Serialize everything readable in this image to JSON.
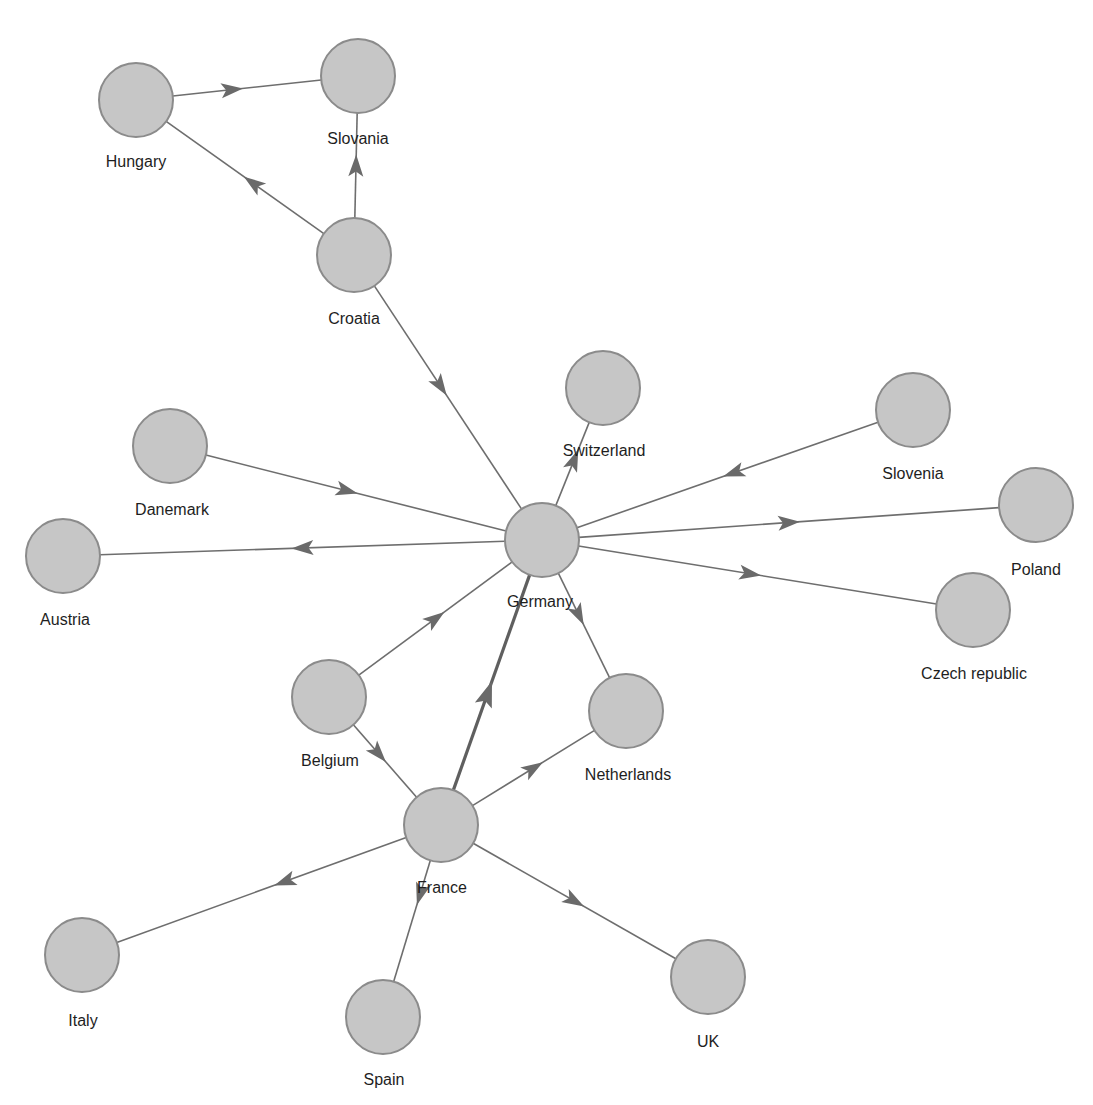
{
  "diagram": {
    "type": "directed-graph",
    "node_radius": 37,
    "colors": {
      "node_fill": "#c6c6c6",
      "node_stroke": "#8b8b8b",
      "edge": "#6e6e6e",
      "arrow": "#6a6a6a",
      "label": "#1e1e1e"
    },
    "nodes": [
      {
        "id": "hungary",
        "label": "Hungary",
        "x": 136,
        "y": 100,
        "lx": 136,
        "ly": 163
      },
      {
        "id": "slovania",
        "label": "Slovania",
        "x": 358,
        "y": 76,
        "lx": 358,
        "ly": 140
      },
      {
        "id": "croatia",
        "label": "Croatia",
        "x": 354,
        "y": 255,
        "lx": 354,
        "ly": 320
      },
      {
        "id": "switzerland",
        "label": "Switzerland",
        "x": 603,
        "y": 388,
        "lx": 604,
        "ly": 452
      },
      {
        "id": "slovenia",
        "label": "Slovenia",
        "x": 913,
        "y": 410,
        "lx": 913,
        "ly": 475
      },
      {
        "id": "danemark",
        "label": "Danemark",
        "x": 170,
        "y": 446,
        "lx": 172,
        "ly": 511
      },
      {
        "id": "germany",
        "label": "Germany",
        "x": 542,
        "y": 540,
        "lx": 540,
        "ly": 603
      },
      {
        "id": "poland",
        "label": "Poland",
        "x": 1036,
        "y": 505,
        "lx": 1036,
        "ly": 571
      },
      {
        "id": "austria",
        "label": "Austria",
        "x": 63,
        "y": 556,
        "lx": 65,
        "ly": 621
      },
      {
        "id": "czech",
        "label": "Czech republic",
        "x": 973,
        "y": 610,
        "lx": 974,
        "ly": 675
      },
      {
        "id": "belgium",
        "label": "Belgium",
        "x": 329,
        "y": 697,
        "lx": 330,
        "ly": 762
      },
      {
        "id": "netherlands",
        "label": "Netherlands",
        "x": 626,
        "y": 711,
        "lx": 628,
        "ly": 776
      },
      {
        "id": "france",
        "label": "France",
        "x": 441,
        "y": 825,
        "lx": 442,
        "ly": 889
      },
      {
        "id": "italy",
        "label": "Italy",
        "x": 82,
        "y": 955,
        "lx": 83,
        "ly": 1022
      },
      {
        "id": "spain",
        "label": "Spain",
        "x": 383,
        "y": 1017,
        "lx": 384,
        "ly": 1081
      },
      {
        "id": "uk",
        "label": "UK",
        "x": 708,
        "y": 977,
        "lx": 708,
        "ly": 1043
      }
    ],
    "edges": [
      {
        "from": "hungary",
        "to": "slovania",
        "arrow_t": 0.4
      },
      {
        "from": "croatia",
        "to": "slovania",
        "arrow_t": 0.5
      },
      {
        "from": "croatia",
        "to": "hungary",
        "arrow_t": 0.45
      },
      {
        "from": "croatia",
        "to": "germany",
        "arrow_t": 0.45
      },
      {
        "from": "danemark",
        "to": "germany",
        "arrow_t": 0.47
      },
      {
        "from": "germany",
        "to": "austria",
        "arrow_t": 0.5
      },
      {
        "from": "germany",
        "to": "switzerland",
        "arrow_t": 0.55
      },
      {
        "from": "slovenia",
        "to": "germany",
        "arrow_t": 0.48
      },
      {
        "from": "germany",
        "to": "poland",
        "arrow_t": 0.5
      },
      {
        "from": "germany",
        "to": "czech",
        "arrow_t": 0.48
      },
      {
        "from": "germany",
        "to": "netherlands",
        "arrow_t": 0.4
      },
      {
        "from": "belgium",
        "to": "germany",
        "arrow_t": 0.5
      },
      {
        "from": "belgium",
        "to": "france",
        "arrow_t": 0.4
      },
      {
        "from": "france",
        "to": "germany",
        "arrow_t": 0.45,
        "heavy": true
      },
      {
        "from": "france",
        "to": "netherlands",
        "arrow_t": 0.5
      },
      {
        "from": "france",
        "to": "italy",
        "arrow_t": 0.42
      },
      {
        "from": "france",
        "to": "spain",
        "arrow_t": 0.28
      },
      {
        "from": "france",
        "to": "uk",
        "arrow_t": 0.5
      }
    ]
  }
}
